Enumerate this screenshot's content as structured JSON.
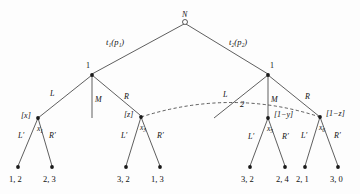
{
  "figure": {
    "kind": "game-tree-diagram",
    "background_color": "#fdfdfd",
    "line_color": "#1a1a1a",
    "root": {
      "label": "N",
      "node_style": "open-circle"
    },
    "top_edges": [
      {
        "name": "left-top-edge",
        "label": "t₁(p₁)"
      },
      {
        "name": "right-top-edge",
        "label": "t₂(p₂)"
      }
    ],
    "information_sets": [
      {
        "name": "left-information-set",
        "label": "1"
      },
      {
        "name": "right-information-set",
        "label": "1"
      }
    ],
    "branch_labels": {
      "left_L": "L",
      "left_M": "M",
      "left_R": "R",
      "right_L": "L",
      "right_M": "M",
      "right_R": "R"
    },
    "deviation_label": "2",
    "subtree_labels": [
      {
        "name": "bracket-x",
        "text": "[x]"
      },
      {
        "name": "bracket-z",
        "text": "[z]"
      },
      {
        "name": "bracket-1-mnus-y",
        "text": "[1−y]"
      },
      {
        "name": "bracket-1-mnus-z",
        "text": "[1−z]"
      }
    ],
    "decision_nodes": [
      {
        "name": "node-x1",
        "subscript_label": "x",
        "subscript_index": "1",
        "left_branch": "L′",
        "right_branch": "R′"
      },
      {
        "name": "node-x3",
        "subscript_label": "x",
        "subscript_index": "3",
        "left_branch": "L′",
        "right_branch": "R′"
      },
      {
        "name": "node-x5",
        "subscript_label": "x",
        "subscript_index": "5",
        "left_branch": "L′",
        "right_branch": "R′"
      },
      {
        "name": "node-x6",
        "subscript_label": "x",
        "subscript_index": "6",
        "left_branch": "L′",
        "right_branch": "R′"
      }
    ],
    "payoffs": [
      {
        "name": "payoff-1",
        "text": "1, 2"
      },
      {
        "name": "payoff-2",
        "text": "2, 3"
      },
      {
        "name": "payoff-3",
        "text": "3, 2"
      },
      {
        "name": "payoff-4",
        "text": "1, 3"
      },
      {
        "name": "payoff-5",
        "text": "3, 2"
      },
      {
        "name": "payoff-6",
        "text": "2, 4"
      },
      {
        "name": "payoff-7",
        "text": "2, 1"
      },
      {
        "name": "payoff-8",
        "text": "3, 0"
      }
    ]
  }
}
